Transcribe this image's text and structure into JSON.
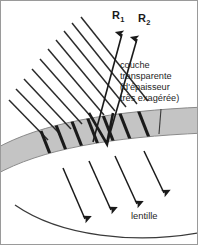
{
  "figure": {
    "width": 198,
    "height": 245,
    "background_color": "#ffffff",
    "border_color": "#9a9a9a"
  },
  "labels": {
    "ray_1": "R",
    "ray_1_sub": "1",
    "ray_2": "R",
    "ray_2_sub": "2",
    "lens": "lentille"
  },
  "annotation": {
    "line1": "couche",
    "line2": "transparente",
    "line3": "(d'épaisseur",
    "line4": "très exagérée)"
  },
  "colors": {
    "layer_fill": "#c4c4c4",
    "layer_stroke": "#8f8f8f",
    "ray_stroke": "#2b2b2b",
    "thick_ray_stroke": "#1a1a1a",
    "lens_curve": "#3a3a3a",
    "leader_line": "#3a3a3a",
    "text": "#1f1f1f"
  },
  "geometry": {
    "incoming_rays_count": 10,
    "internal_thick_rays_count": 7,
    "reflected_rays_count": 2,
    "transmitted_rays_count": 4,
    "layer_thickness_px": 26
  }
}
